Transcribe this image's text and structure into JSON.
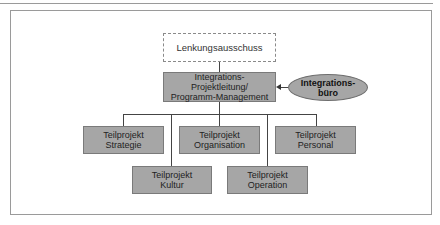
{
  "diagram": {
    "type": "org-chart",
    "steering": {
      "label": "Lenkungsausschuss",
      "style": "dashed"
    },
    "program_management": {
      "label": "Integrations-\nProjektleitung/\nProgramm-Management"
    },
    "integration_office": {
      "label": "Integrations-\nbüro",
      "shape": "ellipse"
    },
    "subprojects_row1": [
      {
        "label": "Teilprojekt\nStrategie"
      },
      {
        "label": "Teilprojekt\nOrganisation"
      },
      {
        "label": "Teilprojekt\nPersonal"
      }
    ],
    "subprojects_row2": [
      {
        "label": "Teilprojekt\nKultur"
      },
      {
        "label": "Teilprojekt\nOperation"
      }
    ],
    "colors": {
      "box_fill": "#a6a6a6",
      "border": "#7a7a7a",
      "lines": "#444444"
    }
  }
}
